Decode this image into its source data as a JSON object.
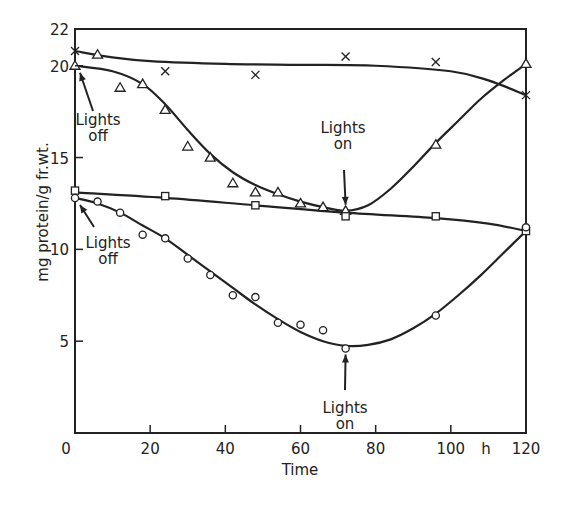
{
  "chart_data": {
    "type": "line",
    "title": "",
    "xlabel": "Time",
    "x_unit": "h",
    "ylabel": "mg protein/g fr.wt.",
    "xlim": [
      0,
      120
    ],
    "ylim": [
      0,
      22
    ],
    "xticks": [
      0,
      20,
      40,
      60,
      80,
      100,
      120
    ],
    "xtick_labels": [
      "0",
      "20",
      "40",
      "60",
      "80",
      "100",
      "120"
    ],
    "yticks": [
      5,
      10,
      15,
      20,
      22
    ],
    "ytick_labels": [
      "5",
      "10",
      "15",
      "20",
      "22"
    ],
    "grid": false,
    "legend": "none (series distinguished by marker)",
    "series": [
      {
        "name": "crosses",
        "marker": "x",
        "x": [
          0,
          24,
          48,
          72,
          96,
          120
        ],
        "y": [
          20.8,
          19.7,
          19.5,
          20.5,
          20.2,
          18.4
        ],
        "curve_x": [
          0,
          10,
          20,
          40,
          60,
          80,
          100,
          110,
          120
        ],
        "curve_y": [
          20.8,
          20.45,
          20.25,
          20.1,
          20.05,
          20.0,
          19.7,
          19.2,
          18.4
        ]
      },
      {
        "name": "triangles",
        "marker": "triangle",
        "x": [
          0,
          6,
          12,
          18,
          24,
          30,
          36,
          42,
          48,
          54,
          60,
          66,
          72,
          96,
          120
        ],
        "y": [
          20.0,
          20.6,
          18.8,
          19.0,
          17.6,
          15.6,
          15.0,
          13.6,
          13.1,
          13.1,
          12.5,
          12.3,
          12.1,
          15.7,
          20.1
        ],
        "curve_x": [
          0,
          10,
          18,
          24,
          30,
          36,
          42,
          48,
          54,
          60,
          66,
          72,
          78,
          84,
          90,
          96,
          102,
          108,
          114,
          120
        ],
        "curve_y": [
          20.0,
          19.7,
          19.0,
          17.9,
          16.5,
          15.2,
          14.2,
          13.5,
          13.0,
          12.6,
          12.3,
          12.1,
          12.4,
          13.3,
          14.5,
          15.8,
          17.0,
          18.2,
          19.2,
          20.1
        ]
      },
      {
        "name": "squares",
        "marker": "square",
        "x": [
          0,
          24,
          48,
          72,
          96,
          120
        ],
        "y": [
          13.2,
          12.9,
          12.4,
          11.8,
          11.8,
          11.0
        ],
        "curve_x": [
          0,
          24,
          48,
          72,
          96,
          110,
          120
        ],
        "curve_y": [
          13.1,
          12.8,
          12.4,
          12.0,
          11.7,
          11.4,
          11.0
        ]
      },
      {
        "name": "circles",
        "marker": "circle",
        "x": [
          0,
          6,
          12,
          18,
          24,
          30,
          36,
          42,
          48,
          54,
          60,
          66,
          72,
          96,
          120
        ],
        "y": [
          12.8,
          12.6,
          12.0,
          10.8,
          10.6,
          9.5,
          8.6,
          7.5,
          7.4,
          6.0,
          5.9,
          5.6,
          4.6,
          6.4,
          11.2
        ],
        "curve_x": [
          0,
          6,
          12,
          18,
          24,
          30,
          36,
          42,
          48,
          54,
          60,
          66,
          72,
          78,
          84,
          90,
          96,
          102,
          108,
          114,
          120
        ],
        "curve_y": [
          12.8,
          12.5,
          12.0,
          11.3,
          10.6,
          9.7,
          8.8,
          7.9,
          7.0,
          6.2,
          5.5,
          5.0,
          4.75,
          4.8,
          5.1,
          5.7,
          6.5,
          7.5,
          8.6,
          9.8,
          11.0
        ]
      }
    ],
    "annotations": [
      {
        "id": "lights-off-top",
        "line1": "Lights",
        "line2": "off",
        "target": {
          "x": 0,
          "y": 20.0
        }
      },
      {
        "id": "lights-off-bottom",
        "line1": "Lights",
        "line2": "off",
        "target": {
          "x": 0,
          "y": 12.8
        }
      },
      {
        "id": "lights-on-top",
        "line1": "Lights",
        "line2": "on",
        "target": {
          "x": 72,
          "y": 12.1
        }
      },
      {
        "id": "lights-on-bottom",
        "line1": "Lights",
        "line2": "on",
        "target": {
          "x": 72,
          "y": 4.6
        }
      }
    ]
  }
}
